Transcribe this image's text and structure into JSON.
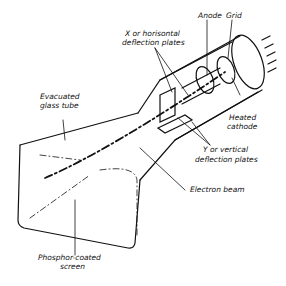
{
  "diagram": {
    "labels": {
      "anode": "Anode",
      "grid": "Grid",
      "x_plates_1": "X or horisontal",
      "x_plates_2": "deflection plates",
      "heated_cathode_1": "Heated",
      "heated_cathode_2": "cathode",
      "evacuated_1": "Evacuated",
      "evacuated_2": "glass tube",
      "y_plates_1": "Y or vertical",
      "y_plates_2": "deflection plates",
      "electron_beam": "Electron beam",
      "phosphor_1": "Phosphor-coated",
      "phosphor_2": "screen"
    }
  }
}
